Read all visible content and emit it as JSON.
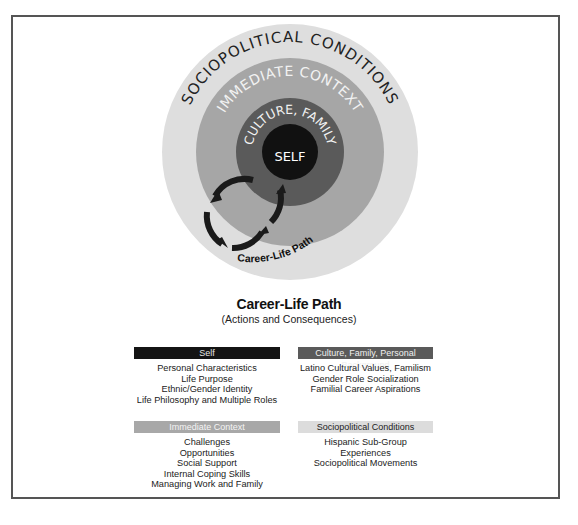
{
  "diagram": {
    "rings": [
      {
        "label": "SOCIOPOLITICAL CONDITIONS",
        "color": "#dedede",
        "radius": 128,
        "text_color": "#222222"
      },
      {
        "label": "IMMEDIATE CONTEXT",
        "color": "#a6a6a6",
        "radius": 94,
        "text_color": "#f2f2f2"
      },
      {
        "label": "CULTURE, FAMILY",
        "color": "#5a5a5a",
        "radius": 54,
        "text_color": "#f2f2f2"
      },
      {
        "label": "SELF",
        "color": "#111111",
        "radius": 28,
        "text_color": "#ffffff"
      }
    ],
    "path_label": "Career-Life Path"
  },
  "title": {
    "main": "Career-Life Path",
    "sub": "(Actions and Consequences)"
  },
  "boxes": [
    {
      "header": "Self",
      "items": [
        "Personal Characteristics",
        "Life Purpose",
        "Ethnic/Gender Identity",
        "Life Philosophy and Multiple Roles"
      ]
    },
    {
      "header": "Culture, Family, Personal Background",
      "items": [
        "Latino Cultural Values, Familism",
        "Gender Role Socialization",
        "Familial Career Aspirations"
      ]
    },
    {
      "header": "Immediate Context",
      "items": [
        "Challenges",
        "Opportunities",
        "Social Support",
        "Internal Coping Skills",
        "Managing Work and Family"
      ]
    },
    {
      "header": "Sociopolitical Conditions",
      "items": [
        "Hispanic Sub-Group Experiences",
        "Sociopolitical Movements"
      ]
    }
  ]
}
